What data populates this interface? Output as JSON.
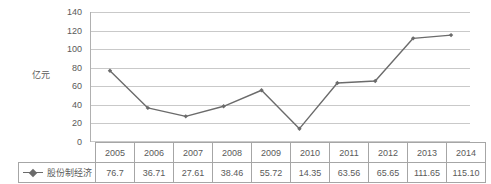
{
  "chart_data": {
    "type": "line",
    "title": "",
    "xlabel": "",
    "ylabel": "亿元",
    "ylim": [
      0,
      140
    ],
    "ytick_step": 20,
    "yticks": [
      140,
      120,
      100,
      80,
      60,
      40,
      20,
      0
    ],
    "grid": true,
    "legend_position": "table-row-header",
    "categories": [
      "2005",
      "2006",
      "2007",
      "2008",
      "2009",
      "2010",
      "2011",
      "2012",
      "2013",
      "2014"
    ],
    "series": [
      {
        "name": "股份制经济",
        "values": [
          76.7,
          36.71,
          27.61,
          38.46,
          55.72,
          14.35,
          63.56,
          65.65,
          111.65,
          115.1
        ],
        "value_labels": [
          "76.7",
          "36.71",
          "27.61",
          "38.46",
          "55.72",
          "14.35",
          "63.56",
          "65.65",
          "111.65",
          "115.10"
        ],
        "color": "#6b6b6b",
        "marker": "diamond"
      }
    ]
  },
  "table": {
    "header_row": [
      "2005",
      "2006",
      "2007",
      "2008",
      "2009",
      "2010",
      "2011",
      "2012",
      "2013",
      "2014"
    ],
    "data_row": {
      "label": "股份制经济",
      "values": [
        "76.7",
        "36.71",
        "27.61",
        "38.46",
        "55.72",
        "14.35",
        "63.56",
        "65.65",
        "111.65",
        "115.10"
      ]
    }
  },
  "colors": {
    "series_line": "#6b6b6b",
    "gridline": "#c9c9c9",
    "axis": "#b0b0b0",
    "text": "#5a5a5a"
  }
}
